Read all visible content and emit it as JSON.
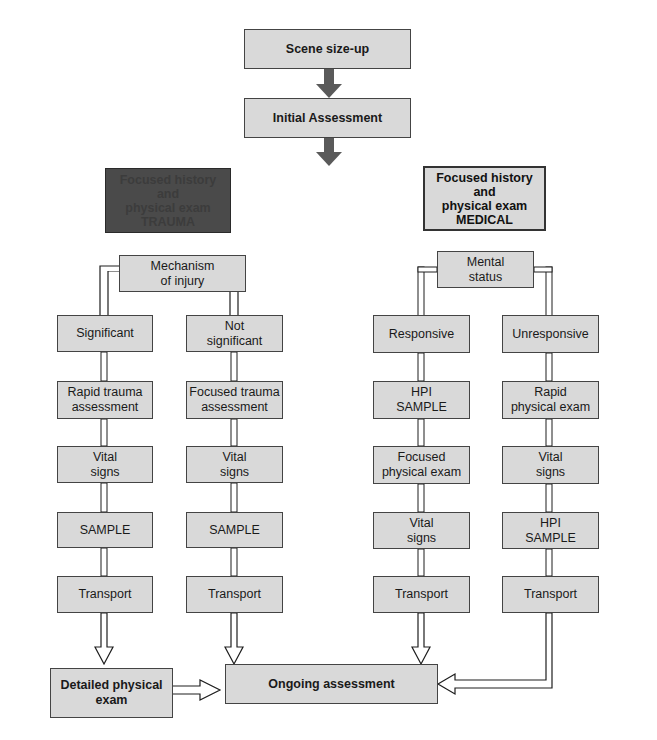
{
  "flow": {
    "top": [
      {
        "id": "scene",
        "label": "Scene size-up"
      },
      {
        "id": "initial",
        "label": "Initial Assessment"
      }
    ],
    "trauma": {
      "header": "Focused history\nand\nphysical exam\nTRAUMA",
      "decision": "Mechanism\nof injury",
      "columns": [
        {
          "steps": [
            "Significant",
            "Rapid trauma\nassessment",
            "Vital\nsigns",
            "SAMPLE",
            "Transport"
          ]
        },
        {
          "steps": [
            "Not\nsignificant",
            "Focused trauma\nassessment",
            "Vital\nsigns",
            "SAMPLE",
            "Transport"
          ]
        }
      ]
    },
    "medical": {
      "header": "Focused history\nand\nphysical exam\nMEDICAL",
      "decision": "Mental\nstatus",
      "columns": [
        {
          "steps": [
            "Responsive",
            "HPI\nSAMPLE",
            "Focused\nphysical exam",
            "Vital\nsigns",
            "Transport"
          ]
        },
        {
          "steps": [
            "Unresponsive",
            "Rapid\nphysical exam",
            "Vital\nsigns",
            "HPI\nSAMPLE",
            "Transport"
          ]
        }
      ]
    },
    "bottom": [
      {
        "id": "detailed",
        "label": "Detailed physical\nexam"
      },
      {
        "id": "ongoing",
        "label": "Ongoing assessment"
      }
    ]
  },
  "colors": {
    "box_fill": "#d9d9d9",
    "trauma_panel": "#7f7f7f",
    "trauma_header": "#4a4a4a",
    "medical_panel": "#ffffff",
    "arrow_solid": "#5a5a5a"
  }
}
